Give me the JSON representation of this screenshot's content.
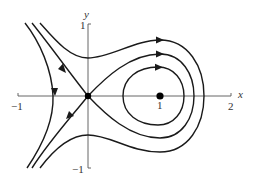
{
  "figure": {
    "axes": {
      "x_label": "x",
      "y_label": "y",
      "x_ticks": [
        "−1",
        "1",
        "2"
      ],
      "y_ticks": [
        "1",
        "−1"
      ]
    },
    "colors": {
      "curve": "#1a1a1a",
      "axis": "#555555",
      "point": "#000000"
    },
    "fixed_points": [
      {
        "name": "saddle",
        "x": 0,
        "y": 0
      },
      {
        "name": "center",
        "x": 1,
        "y": 0
      }
    ],
    "trajectories": [
      {
        "name": "inner closed orbit",
        "type": "closed",
        "direction": "clockwise"
      },
      {
        "name": "homoclinic loop",
        "type": "separatrix",
        "direction": "clockwise"
      },
      {
        "name": "outer orbit upper",
        "type": "open"
      },
      {
        "name": "stable manifold",
        "type": "separatrix"
      },
      {
        "name": "leftmost orbit",
        "type": "open"
      }
    ]
  }
}
